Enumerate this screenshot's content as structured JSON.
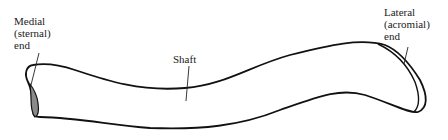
{
  "diagram": {
    "labels": {
      "medial": [
        "Medial",
        "(sternal)",
        "end"
      ],
      "shaft": "Shaft",
      "lateral": [
        "Lateral",
        "(acromial)",
        "end"
      ]
    },
    "colors": {
      "outline": "#111111",
      "sternal_facet_fill": "#8a8a8a",
      "text": "#222222"
    }
  }
}
